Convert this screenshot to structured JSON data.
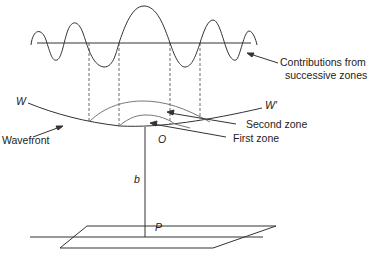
{
  "diagram": {
    "labels": {
      "contributions_line1": "Contributions from",
      "contributions_line2": "successive zones",
      "W": "W",
      "W_prime": "W′",
      "second_zone": "Second zone",
      "first_zone": "First zone",
      "wavefront": "Wavefront",
      "O": "O",
      "b": "b",
      "P": "P"
    },
    "colors": {
      "line": "#333333",
      "arc": "#777777",
      "text": "#222222"
    }
  }
}
